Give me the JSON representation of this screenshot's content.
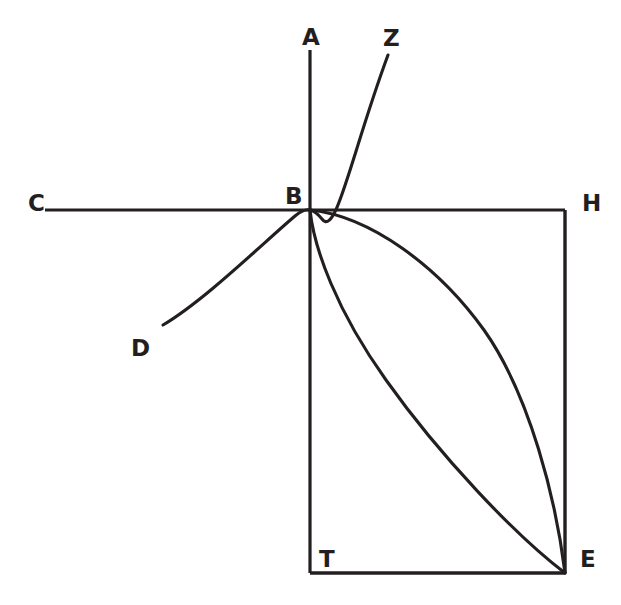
{
  "figure": {
    "background_color": "#ffffff",
    "ink_color": "#231f20",
    "canvas": {
      "width": 621,
      "height": 605
    }
  },
  "points": [
    {
      "id": "A",
      "label": "A",
      "x": 310,
      "y": 50,
      "label_x": 302,
      "label_y": 26,
      "role": "top-of-vertical-axis"
    },
    {
      "id": "Z",
      "label": "Z",
      "x": 388,
      "y": 55,
      "label_x": 383,
      "label_y": 27,
      "role": "upper-curve-endpoint"
    },
    {
      "id": "C",
      "label": "C",
      "x": 45,
      "y": 210,
      "label_x": 28,
      "label_y": 192,
      "role": "left-of-horizontal-axis"
    },
    {
      "id": "B",
      "label": "B",
      "x": 310,
      "y": 210,
      "label_x": 285,
      "label_y": 185,
      "role": "central-intersection"
    },
    {
      "id": "H",
      "label": "H",
      "x": 565,
      "y": 210,
      "label_x": 582,
      "label_y": 192,
      "role": "top-right-corner"
    },
    {
      "id": "D",
      "label": "D",
      "x": 163,
      "y": 325,
      "label_x": 131,
      "label_y": 337,
      "role": "lower-left-curve-endpoint"
    },
    {
      "id": "T",
      "label": "T",
      "x": 310,
      "y": 573,
      "label_x": 319,
      "label_y": 548,
      "role": "bottom-left-corner"
    },
    {
      "id": "E",
      "label": "E",
      "x": 565,
      "y": 573,
      "label_x": 580,
      "label_y": 548,
      "role": "bottom-right-corner"
    }
  ],
  "segments": [
    {
      "id": "AT",
      "name": "vertical-axis",
      "from": "A",
      "to": "T",
      "kind": "line"
    },
    {
      "id": "CH",
      "name": "horizontal-axis",
      "from": "C",
      "to": "H",
      "kind": "line"
    },
    {
      "id": "HE",
      "name": "right-side",
      "from": "H",
      "to": "E",
      "kind": "line"
    },
    {
      "id": "TE",
      "name": "bottom-side",
      "from": "T",
      "to": "E",
      "kind": "line"
    }
  ],
  "curves": [
    {
      "id": "DBZ",
      "name": "curve-d-b-z",
      "through": [
        "D",
        "B",
        "Z"
      ],
      "description": "S-shaped curve tangent to the horizontal axis at B, rising from D through B up to Z",
      "path": "M 163 325 C 205 300 262 244 295 216 C 301 211 306 209 310 210 C 314 211 318 214 322 219 C 336 238 352 152 388 55"
    },
    {
      "id": "BE-outer",
      "name": "curve-b-e-outer",
      "through": [
        "B",
        "E"
      ],
      "description": "Outer arc of the lens, bulging toward the upper right, from B to E",
      "path": "M 310 210 C 370 216 438 266 484 330 C 530 395 556 500 565 573"
    },
    {
      "id": "BE-inner",
      "name": "curve-b-e-inner",
      "through": [
        "B",
        "E"
      ],
      "description": "Inner arc of the lens, leaving B steeply downward then sweeping right to E",
      "path": "M 310 210 C 314 248 336 310 386 380 C 440 456 516 536 565 573"
    }
  ],
  "labels": {
    "A": "A",
    "Z": "Z",
    "C": "C",
    "B": "B",
    "H": "H",
    "D": "D",
    "T": "T",
    "E": "E"
  }
}
